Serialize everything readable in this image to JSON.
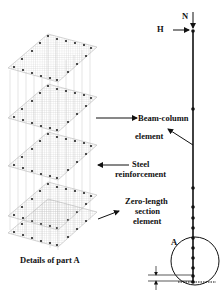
{
  "labels": {
    "N": "N",
    "H": "H",
    "beam_column_line1": "Beam-column",
    "beam_column_line2": "element",
    "steel_line1": "Steel",
    "steel_line2": "reinforcement",
    "zero_line1": "Zero-length",
    "zero_line2": "section",
    "zero_line3": "element",
    "part_a": "A",
    "details_caption": "Details of part A"
  },
  "colors": {
    "line": "#111111",
    "grid": "#b0b0b0",
    "dot": "#222222"
  }
}
